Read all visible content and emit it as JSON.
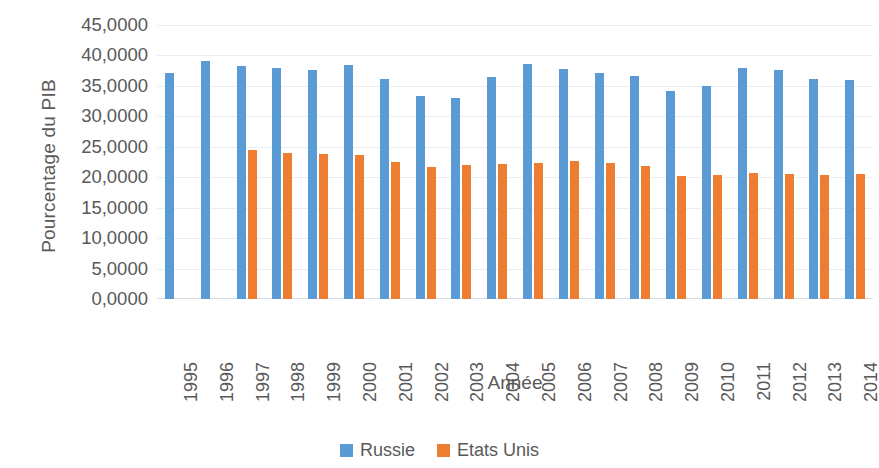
{
  "chart_data": {
    "type": "bar",
    "title": "",
    "xlabel": "Année",
    "ylabel": "Pourcentage du PIB",
    "categories": [
      "1995",
      "1996",
      "1997",
      "1998",
      "1999",
      "2000",
      "2001",
      "2002",
      "2003",
      "2004",
      "2005",
      "2006",
      "2007",
      "2008",
      "2009",
      "2010",
      "2011",
      "2012",
      "2013",
      "2014"
    ],
    "series": [
      {
        "name": "Russie",
        "color": "#5b9bd5",
        "values": [
          37.1,
          39.1,
          38.3,
          37.9,
          37.6,
          38.4,
          36.1,
          33.4,
          33.0,
          36.5,
          38.6,
          37.8,
          37.1,
          36.6,
          34.2,
          35.0,
          38.0,
          37.6,
          36.1,
          36.0
        ]
      },
      {
        "name": "Etats Unis",
        "color": "#ed7d31",
        "values": [
          null,
          null,
          24.5,
          24.0,
          23.8,
          23.7,
          22.5,
          21.7,
          22.0,
          22.2,
          22.3,
          22.7,
          22.3,
          21.9,
          20.2,
          20.4,
          20.7,
          20.5,
          20.4,
          20.5
        ]
      }
    ],
    "ylim": [
      0,
      45
    ],
    "ytick_values": [
      45,
      40,
      35,
      30,
      25,
      20,
      15,
      10,
      5,
      0
    ],
    "ytick_labels": [
      "45,0000",
      "40,0000",
      "35,0000",
      "30,0000",
      "25,0000",
      "20,0000",
      "15,0000",
      "10,0000",
      "5,0000",
      "0,0000"
    ],
    "grid": true,
    "legend_position": "bottom"
  },
  "legend": {
    "items": [
      {
        "label": "Russie",
        "color": "#5b9bd5"
      },
      {
        "label": "Etats Unis",
        "color": "#ed7d31"
      }
    ]
  }
}
